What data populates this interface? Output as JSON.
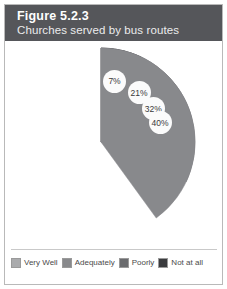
{
  "figure": {
    "title": "Figure 5.2.3",
    "subtitle": "Churches served by bus routes",
    "header_bg": "#55565a",
    "title_color": "#ffffff"
  },
  "chart_data": {
    "type": "pie",
    "title": "Churches served by bus routes",
    "xlabel": "",
    "ylabel": "",
    "legend_position": "bottom",
    "grid": false,
    "categories": [
      "Very Well",
      "Adequately",
      "Poorly",
      "Not at all"
    ],
    "values": [
      21,
      40,
      32,
      7
    ],
    "value_labels": [
      "21%",
      "40%",
      "32%",
      "7%"
    ],
    "colors": [
      "#aaabad",
      "#88898c",
      "#6a6b6e",
      "#3a3b3e"
    ],
    "slices": [
      {
        "label": "Very Well",
        "value": 21,
        "display": "21%",
        "color": "#aaabad"
      },
      {
        "label": "Not at all",
        "value": 7,
        "display": "7%",
        "color": "#3a3b3e"
      },
      {
        "label": "Poorly",
        "value": 32,
        "display": "32%",
        "color": "#6a6b6e"
      },
      {
        "label": "Adequately",
        "value": 40,
        "display": "40%",
        "color": "#88898c"
      }
    ]
  },
  "legend": {
    "items": [
      {
        "label": "Very Well",
        "color": "#aaabad"
      },
      {
        "label": "Adequately",
        "color": "#88898c"
      },
      {
        "label": "Poorly",
        "color": "#6a6b6e"
      },
      {
        "label": "Not at all",
        "color": "#3a3b3e"
      }
    ]
  }
}
